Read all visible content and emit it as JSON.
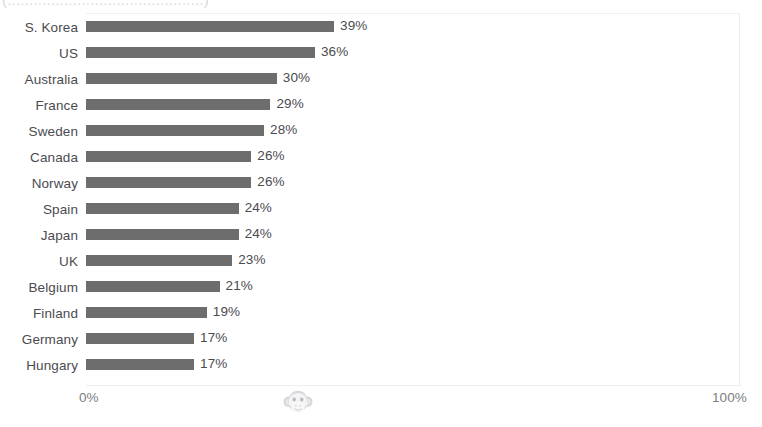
{
  "chart_data": {
    "type": "bar",
    "orientation": "horizontal",
    "title": "",
    "xlabel": "",
    "ylabel": "",
    "xlim": [
      0,
      100
    ],
    "xticks": [
      "0%",
      "100%"
    ],
    "grid": false,
    "legend": null,
    "value_suffix": "%",
    "categories": [
      "S. Korea",
      "US",
      "Australia",
      "France",
      "Sweden",
      "Canada",
      "Norway",
      "Spain",
      "Japan",
      "UK",
      "Belgium",
      "Finland",
      "Germany",
      "Hungary"
    ],
    "values": [
      39,
      36,
      30,
      29,
      28,
      26,
      26,
      24,
      24,
      23,
      21,
      19,
      17,
      17
    ],
    "data_labels": [
      "39%",
      "36%",
      "30%",
      "29%",
      "28%",
      "26%",
      "26%",
      "24%",
      "24%",
      "23%",
      "21%",
      "19%",
      "17%",
      "17%"
    ],
    "series": [
      {
        "name": "",
        "values": [
          39,
          36,
          30,
          29,
          28,
          26,
          26,
          24,
          24,
          23,
          21,
          19,
          17,
          17
        ]
      }
    ]
  },
  "axis": {
    "min_label": "0%",
    "max_label": "100%"
  },
  "title_strip": {
    "clipped_text": "(.............................................)"
  },
  "watermark": {
    "icon": "monkey-face-icon"
  },
  "colors": {
    "bar": "#6d6d6d",
    "label_text": "#4b4b4f",
    "tick_text": "#7d7d83",
    "background": "#ffffff",
    "frame": "#f1f1f3"
  }
}
